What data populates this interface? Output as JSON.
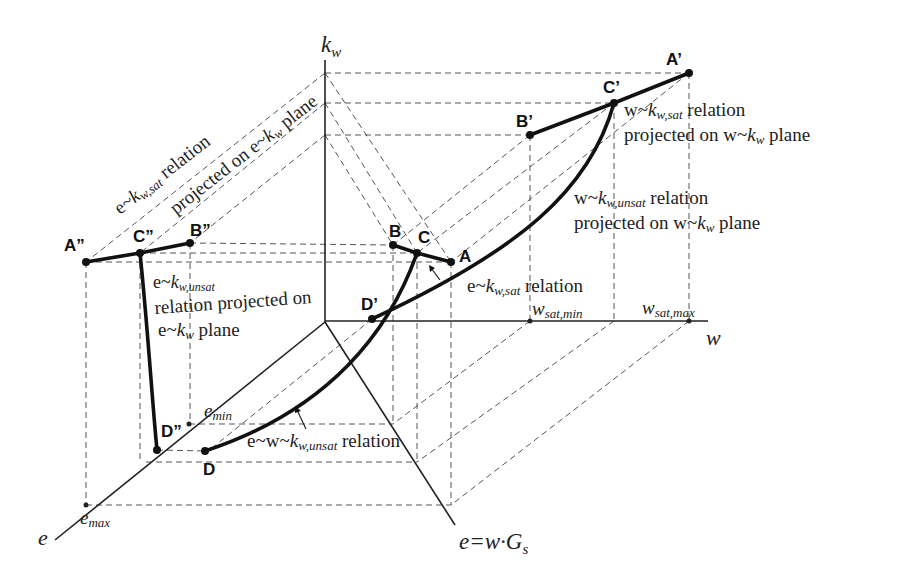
{
  "axes": {
    "kw": {
      "main": "k",
      "sub": "w"
    },
    "w": {
      "label": "w"
    },
    "e": {
      "label": "e"
    },
    "e_wGs": {
      "prefix": "e=w·G",
      "sub": "s"
    }
  },
  "ticks": {
    "w_sat_min": {
      "main": "w",
      "sub": "sat,min"
    },
    "w_sat_max": {
      "main": "w",
      "sub": "sat,max"
    },
    "e_min": {
      "main": "e",
      "sub": "min"
    },
    "e_max": {
      "main": "e",
      "sub": "max"
    }
  },
  "points": {
    "A": "A",
    "B": "B",
    "C": "C",
    "D": "D",
    "A1": "A’",
    "B1": "B’",
    "C1": "C’",
    "D1": "D’",
    "A2": "A”",
    "B2": "B”",
    "C2": "C”",
    "D2": "D”"
  },
  "labels": {
    "e_kwsat_rel": {
      "pre": "e~",
      "k": "k",
      "sub": "w,sat",
      "post": " relation"
    },
    "proj_on_ekw": {
      "pre": "projected on e~",
      "k": "k",
      "sub": "w",
      "post": " plane"
    },
    "w_kwsat_rel": {
      "pre": "w~",
      "k": "k",
      "sub": "w,sat",
      "post": "  relation"
    },
    "w_kwsat_proj": {
      "pre": "projected on w~",
      "k": "k",
      "sub": "w",
      "post": "  plane"
    },
    "w_kwunsat_rel": {
      "pre": "w~",
      "k": "k",
      "sub": "w,unsat",
      "post": "  relation"
    },
    "w_kwunsat_proj": {
      "pre": "projected on w~",
      "k": "k",
      "sub": "w",
      "post": "  plane"
    },
    "e_kwunsat_1": {
      "pre": "e~",
      "k": "k",
      "sub": "w,unsat"
    },
    "e_kwunsat_2": {
      "text": "relation projected on"
    },
    "e_kwunsat_3": {
      "pre": "e~",
      "k": "k",
      "sub": "w",
      "post": "  plane"
    },
    "ekwsat_center": {
      "pre": "e~",
      "k": "k",
      "sub": "w,sat",
      "post": "  relation"
    },
    "ewkwunsat": {
      "pre": "e~w~",
      "k": "k",
      "sub": "w,unsat",
      "post": "  relation"
    }
  }
}
